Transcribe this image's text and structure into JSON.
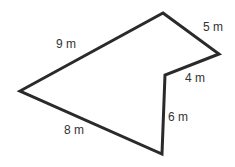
{
  "diagram": {
    "type": "polygon",
    "stroke_color": "#2a2a2a",
    "vertices": [
      [
        163,
        13
      ],
      [
        219,
        54
      ],
      [
        165,
        75
      ],
      [
        162,
        154
      ],
      [
        20,
        91
      ]
    ],
    "sides": [
      {
        "label": "5 m",
        "x": 203,
        "y": 31
      },
      {
        "label": "4 m",
        "x": 185,
        "y": 82
      },
      {
        "label": "6 m",
        "x": 168,
        "y": 121
      },
      {
        "label": "8 m",
        "x": 64,
        "y": 134
      },
      {
        "label": "9 m",
        "x": 56,
        "y": 48
      }
    ]
  }
}
